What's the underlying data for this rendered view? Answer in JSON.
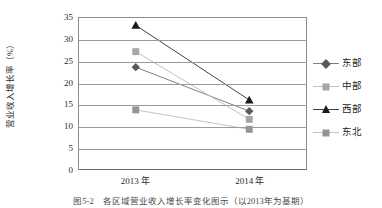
{
  "chart_data": {
    "type": "line",
    "title": "",
    "xlabel": "",
    "ylabel": "营业收入增长率（%）",
    "categories": [
      "2013 年",
      "2014 年"
    ],
    "ylim": [
      0,
      35
    ],
    "yticks": [
      0,
      5,
      10,
      15,
      20,
      25,
      30,
      35
    ],
    "ytick_labels": [
      "0",
      "5",
      "10",
      "15",
      "20",
      "25",
      "30",
      "35"
    ],
    "grid": true,
    "legend_position": "right",
    "series": [
      {
        "name": "东部",
        "marker": "diamond",
        "color": "#595959",
        "line_color": "#7f7f7f",
        "values": [
          23.6,
          13.4
        ]
      },
      {
        "name": "中部",
        "marker": "square",
        "color": "#a6a6a6",
        "line_color": "#bfbfbf",
        "values": [
          27.2,
          11.5
        ]
      },
      {
        "name": "西部",
        "marker": "triangle",
        "color": "#1a1a1a",
        "line_color": "#404040",
        "values": [
          33.3,
          16.0
        ]
      },
      {
        "name": "东北",
        "marker": "square",
        "color": "#949494",
        "line_color": "#c4c4c4",
        "values": [
          13.7,
          9.2
        ]
      }
    ]
  },
  "caption": "图5-2　各区域营业收入增长率变化图示（以2013年为基期）"
}
